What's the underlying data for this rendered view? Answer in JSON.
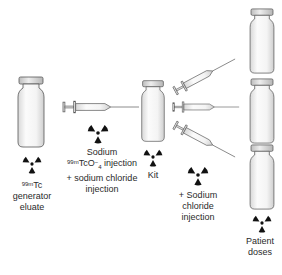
{
  "diagram": {
    "type": "process-flow",
    "colors": {
      "background": "#ffffff",
      "vial_outline": "#555555",
      "vial_fill": "#f4f4f4",
      "cap_fill": "#dcdcdc",
      "radiation_symbol": "#111111",
      "text": "#2a2a2a"
    },
    "nodes": [
      {
        "id": "generator-vial",
        "icon": "vial-icon",
        "radioactive": true,
        "label_prefix_sup": "99m",
        "label_prefix": "Tc",
        "label_line2": "generator",
        "label_line3": "eluate"
      },
      {
        "id": "syringe-transfer",
        "icon": "syringe-icon",
        "radioactive": true,
        "label_line1": "Sodium",
        "label_sup": "99m",
        "label_mid": "TcO",
        "label_minus": "−",
        "label_sub": "4",
        "label_tail": " injection",
        "label_line3": "+ sodium chloride",
        "label_line4": "injection"
      },
      {
        "id": "kit-vial",
        "icon": "vial-icon",
        "radioactive": true,
        "label": "Kit"
      },
      {
        "id": "dispensing-syringes",
        "icon": "syringe-icon",
        "count": 3,
        "radioactive": true,
        "label_line1": "+ Sodium",
        "label_line2": "chloride",
        "label_line3": "injection"
      },
      {
        "id": "patient-dose-vials",
        "icon": "vial-icon",
        "count": 3,
        "radioactive": true,
        "label_line1": "Patient",
        "label_line2": "doses"
      }
    ]
  }
}
